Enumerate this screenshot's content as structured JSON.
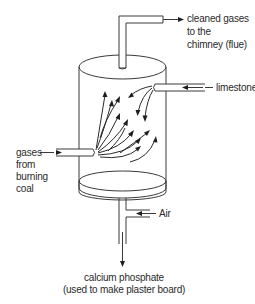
{
  "diagram": {
    "type": "process-apparatus",
    "title": "",
    "labels": {
      "outlet": [
        "cleaned gases",
        "to the",
        "chimney (flue)"
      ],
      "limestone": "limestone",
      "inlet_gases": [
        "gases",
        "from",
        "burning",
        "coal"
      ],
      "air": "Air",
      "product": [
        "calcium phosphate",
        "(used to make plaster board)"
      ]
    },
    "components": [
      {
        "id": "vessel",
        "shape": "cylinder",
        "description": "reaction chamber"
      },
      {
        "id": "flue-pipe",
        "shape": "bent pipe",
        "direction": "out, top"
      },
      {
        "id": "limestone-inlet",
        "shape": "horizontal pipe",
        "direction": "in, upper right"
      },
      {
        "id": "gas-inlet",
        "shape": "horizontal pipe",
        "direction": "in, lower left"
      },
      {
        "id": "perforated-plate",
        "shape": "ellipse",
        "description": "plate near bottom of vessel"
      },
      {
        "id": "air-inlet",
        "shape": "side branch pipe",
        "direction": "in, bottom right"
      },
      {
        "id": "product-outlet",
        "shape": "vertical pipe",
        "direction": "out, bottom"
      }
    ],
    "flows": [
      {
        "from": "gas-inlet",
        "to": "vessel",
        "note": "gases spread upward in curved arrows"
      },
      {
        "from": "limestone-inlet",
        "to": "vessel",
        "note": "limestone sprays downward/left"
      },
      {
        "from": "vessel",
        "to": "flue-pipe",
        "note": "cleaned gases leave"
      },
      {
        "from": "air-inlet",
        "to": "product-outlet"
      },
      {
        "from": "product-outlet",
        "to": "product",
        "note": "calcium phosphate collected"
      }
    ],
    "colors": {
      "stroke": "#3a3a3a",
      "text": "#2b2b2b",
      "background": "#ffffff"
    }
  }
}
